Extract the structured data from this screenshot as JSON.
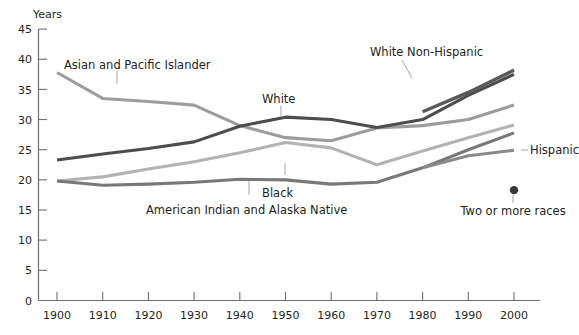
{
  "chart_data": {
    "type": "line",
    "title": "",
    "ylabel": "Years",
    "xlabel": "",
    "ylim": [
      0,
      45
    ],
    "xlim": [
      1900,
      2000
    ],
    "grid": false,
    "legend": "inline-annotations",
    "x": [
      1900,
      1910,
      1920,
      1930,
      1940,
      1950,
      1960,
      1970,
      1980,
      1990,
      2000
    ],
    "y_ticks": [
      "0",
      "5",
      "10",
      "15",
      "20",
      "25",
      "30",
      "35",
      "40",
      "45"
    ],
    "x_ticks": [
      "1900",
      "1910",
      "1920",
      "1930",
      "1940",
      "1950",
      "1960",
      "1970",
      "1980",
      "1990",
      "2000"
    ],
    "series": [
      {
        "name": "Asian and Pacific Islander",
        "color": "#9c9c9c",
        "label": "Asian and Pacific Islander",
        "values": [
          37.8,
          33.5,
          33.0,
          32.4,
          29.0,
          27.0,
          26.5,
          28.6,
          29.0,
          30.0,
          32.4
        ]
      },
      {
        "name": "White",
        "color": "#4d4d4d",
        "label": "White",
        "values": [
          23.3,
          24.3,
          25.2,
          26.3,
          28.9,
          30.4,
          30.0,
          28.7,
          30.0,
          34.0,
          37.5
        ]
      },
      {
        "name": "White Non-Hispanic",
        "color": "#595959",
        "label": "White Non-Hispanic",
        "values": [
          null,
          null,
          null,
          null,
          null,
          null,
          null,
          null,
          31.3,
          34.5,
          38.2
        ]
      },
      {
        "name": "Black",
        "color": "#b3b3b3",
        "label": "Black",
        "values": [
          19.8,
          20.5,
          21.8,
          23.0,
          24.5,
          26.2,
          25.3,
          22.5,
          24.8,
          27.0,
          29.1
        ]
      },
      {
        "name": "American Indian and Alaska Native",
        "color": "#787878",
        "label": "American Indian and Alaska Native",
        "values": [
          19.8,
          19.1,
          19.3,
          19.6,
          20.1,
          20.0,
          19.3,
          19.6,
          22.0,
          25.0,
          27.8
        ]
      },
      {
        "name": "Hispanic",
        "color": "#8a8a8a",
        "label": "Hispanic",
        "values": [
          null,
          null,
          null,
          null,
          null,
          null,
          null,
          null,
          22.0,
          24.0,
          24.9
        ]
      }
    ],
    "points": [
      {
        "name": "Two or more races",
        "label": "Two or more races",
        "color": "#3a3a3a",
        "x": 2000,
        "y": 18.3
      }
    ],
    "annotations": [
      {
        "name": "asian-and-pacific-islander-label",
        "text": "Asian and Pacific Islander"
      },
      {
        "name": "white-label",
        "text": "White"
      },
      {
        "name": "white-non-hispanic-label",
        "text": "White Non-Hispanic"
      },
      {
        "name": "black-label",
        "text": "Black"
      },
      {
        "name": "american-indian-and-alaska-native-label",
        "text": "American Indian and Alaska Native"
      },
      {
        "name": "hispanic-label",
        "text": "Hispanic"
      },
      {
        "name": "two-or-more-races-label",
        "text": "Two or more races"
      }
    ]
  },
  "axis": {
    "y_title": "Years",
    "y_ticks": [
      "45",
      "40",
      "35",
      "30",
      "25",
      "20",
      "15",
      "10",
      "5",
      "0"
    ],
    "x_ticks": [
      "1900",
      "1910",
      "1920",
      "1930",
      "1940",
      "1950",
      "1960",
      "1970",
      "1980",
      "1990",
      "2000"
    ]
  }
}
